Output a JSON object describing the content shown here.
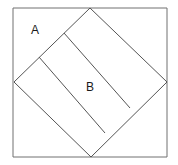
{
  "figure": {
    "title": "",
    "labels": [
      {
        "id": "A",
        "text": "A",
        "x": 33,
        "y": 30,
        "region": "outer-corner-triangle-top-left"
      },
      {
        "id": "B",
        "text": "B",
        "x": 90,
        "y": 88,
        "region": "middle-strip-of-inscribed-square"
      }
    ],
    "colors": {
      "background": "#ffffff",
      "stroke": "#555555",
      "outer_square_stroke": "#707070",
      "label_text": "#1a1a1a"
    },
    "stroke_width": 1,
    "outer_square": {
      "name": "outer-square",
      "points": "13,8 167,8 167,157 13,157"
    },
    "inscribed_square": {
      "name": "inscribed-square-diamond",
      "points": "90,8 167,82 91,157 14,82",
      "vertices": {
        "top": [
          90,
          8
        ],
        "right": [
          167,
          82
        ],
        "bottom": [
          91,
          157
        ],
        "left": [
          14,
          82
        ]
      }
    },
    "internal_lines": [
      {
        "name": "divider-line-1",
        "x1": 39,
        "y1": 57,
        "x2": 105,
        "y2": 133
      },
      {
        "name": "divider-line-2",
        "x1": 64,
        "y1": 33,
        "x2": 130,
        "y2": 108
      }
    ]
  }
}
